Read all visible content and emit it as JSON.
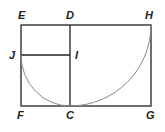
{
  "diagram": {
    "labels": {
      "E": "E",
      "D": "D",
      "H": "H",
      "J": "J",
      "I": "I",
      "F": "F",
      "C": "C",
      "G": "G"
    },
    "colors": {
      "line": "#222222",
      "arc": "#888888"
    }
  }
}
